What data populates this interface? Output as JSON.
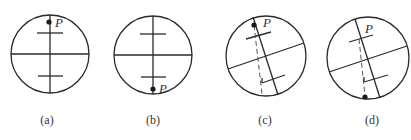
{
  "figure": {
    "point_label": "P",
    "panels": [
      {
        "id": "a",
        "caption": "(a)",
        "description": "Upright crosshair, point P at top of vertical line"
      },
      {
        "id": "b",
        "caption": "(b)",
        "description": "Upright crosshair, point P at bottom of vertical line"
      },
      {
        "id": "c",
        "caption": "(c)",
        "description": "Rotated crosshair, point P near top with dashed plumb line"
      },
      {
        "id": "d",
        "caption": "(d)",
        "description": "Rotated crosshair, point P at bottom with dashed plumb line"
      }
    ]
  }
}
